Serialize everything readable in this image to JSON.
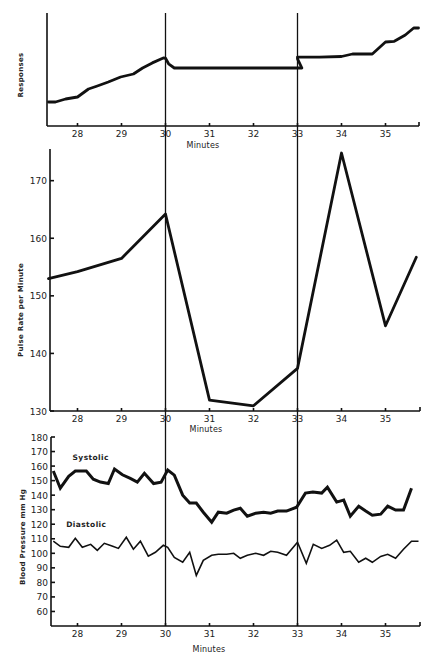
{
  "chart_data": [
    {
      "id": "responses",
      "type": "line",
      "title": "",
      "xlabel": "Minutes",
      "ylabel": "Responses",
      "xlim": [
        27.32,
        35.77
      ],
      "ylim": [
        0,
        100
      ],
      "y_units": "arbitrary (no numeric ticks shown)",
      "x_ticks": [
        28,
        29,
        30,
        31,
        32,
        33,
        34,
        35
      ],
      "x_tick_labels": [
        "28",
        "29",
        "30",
        "31",
        "32",
        "33",
        "34",
        "35"
      ],
      "y_ticks": [],
      "y_tick_labels": [],
      "markers_at_minutes": [
        30,
        33
      ],
      "grid": false,
      "series": [
        {
          "name": "Cumulative responses",
          "style": "thick",
          "x": [
            27.34,
            27.5,
            27.73,
            28.0,
            28.25,
            28.45,
            28.7,
            28.98,
            29.27,
            29.48,
            29.7,
            29.95,
            30.0,
            30.07,
            30.2,
            31.0,
            32.0,
            32.99,
            33.1,
            33.0,
            33.0,
            33.5,
            34.0,
            34.25,
            34.5,
            34.7,
            35.0,
            35.2,
            35.45,
            35.64,
            35.75
          ],
          "y": [
            21.2,
            21.2,
            23.9,
            25.7,
            32.7,
            35.4,
            38.9,
            43.4,
            46.0,
            51.3,
            55.8,
            60.2,
            60.0,
            55.0,
            51.3,
            51.3,
            51.3,
            51.3,
            51.3,
            59.5,
            61.0,
            61.0,
            61.5,
            63.7,
            63.7,
            63.7,
            74.3,
            75.0,
            80.5,
            86.7,
            86.7
          ]
        }
      ]
    },
    {
      "id": "pulse",
      "type": "line",
      "title": "",
      "xlabel": "Minutes",
      "ylabel": "Pulse Rate per Minute",
      "xlim": [
        27.32,
        35.77
      ],
      "ylim": [
        130,
        175.5
      ],
      "x_ticks": [
        28,
        29,
        30,
        31,
        32,
        33,
        34,
        35
      ],
      "x_tick_labels": [
        "28",
        "29",
        "30",
        "31",
        "32",
        "33",
        "34",
        "35"
      ],
      "y_ticks": [
        130,
        140,
        150,
        160,
        170
      ],
      "y_tick_labels": [
        "130",
        "140",
        "150",
        "160",
        "170"
      ],
      "markers_at_minutes": [
        30,
        33
      ],
      "grid": false,
      "series": [
        {
          "name": "Pulse rate",
          "style": "thick",
          "x": [
            27.34,
            28.0,
            29.0,
            30.0,
            31.0,
            32.0,
            33.0,
            34.0,
            35.0,
            35.7
          ],
          "y": [
            153.0,
            154.2,
            156.5,
            164.2,
            131.9,
            130.9,
            137.4,
            174.8,
            144.8,
            156.7
          ]
        }
      ]
    },
    {
      "id": "blood-pressure",
      "type": "line",
      "title": "",
      "xlabel": "Minutes",
      "ylabel": "Blood Pressure mm Hg",
      "xlim": [
        27.32,
        35.77
      ],
      "ylim": [
        50,
        180
      ],
      "x_ticks": [
        28,
        29,
        30,
        31,
        32,
        33,
        34,
        35
      ],
      "x_tick_labels": [
        "28",
        "29",
        "30",
        "31",
        "32",
        "33",
        "34",
        "35"
      ],
      "y_ticks": [
        60,
        70,
        80,
        90,
        100,
        110,
        120,
        130,
        140,
        150,
        160,
        170,
        180
      ],
      "y_tick_labels": [
        "60",
        "70",
        "80",
        "90",
        "100",
        "110",
        "120",
        "130",
        "140",
        "150",
        "160",
        "170",
        "180"
      ],
      "markers_at_minutes": [
        30,
        33
      ],
      "grid": false,
      "series": [
        {
          "name": "Systolic",
          "style": "thick",
          "x": [
            27.45,
            27.61,
            27.8,
            27.95,
            28.2,
            28.36,
            28.52,
            28.7,
            28.84,
            29.02,
            29.2,
            29.36,
            29.52,
            29.73,
            29.9,
            30.05,
            30.2,
            30.39,
            30.55,
            30.7,
            30.86,
            31.05,
            31.2,
            31.39,
            31.55,
            31.7,
            31.86,
            32.05,
            32.23,
            32.39,
            32.55,
            32.75,
            32.98,
            33.18,
            33.35,
            33.55,
            33.68,
            33.89,
            34.05,
            34.2,
            34.39,
            34.55,
            34.7,
            34.89,
            35.05,
            35.23,
            35.41,
            35.59
          ],
          "y": [
            156.6,
            144.8,
            153.0,
            156.6,
            156.6,
            151.0,
            149.0,
            148.0,
            158.0,
            154.0,
            151.5,
            149.0,
            155.0,
            148.0,
            149.0,
            157.2,
            153.8,
            140.0,
            134.5,
            134.5,
            128.3,
            121.4,
            128.3,
            127.6,
            129.7,
            131.0,
            125.5,
            127.6,
            128.3,
            127.6,
            129.0,
            129.0,
            131.7,
            141.4,
            142.1,
            141.4,
            145.5,
            135.2,
            136.6,
            125.5,
            132.4,
            129.0,
            126.2,
            126.9,
            132.4,
            129.7,
            129.7,
            144.8
          ]
        },
        {
          "name": "Diastolic",
          "style": "thin",
          "x": [
            27.45,
            27.61,
            27.8,
            27.95,
            28.11,
            28.3,
            28.45,
            28.61,
            28.8,
            28.93,
            29.11,
            29.27,
            29.43,
            29.61,
            29.77,
            29.95,
            30.05,
            30.2,
            30.39,
            30.55,
            30.7,
            30.86,
            31.05,
            31.2,
            31.39,
            31.55,
            31.7,
            31.86,
            32.05,
            32.23,
            32.39,
            32.55,
            32.75,
            33.0,
            33.2,
            33.36,
            33.55,
            33.73,
            33.89,
            34.05,
            34.2,
            34.39,
            34.55,
            34.7,
            34.89,
            35.05,
            35.23,
            35.41,
            35.59,
            35.75
          ],
          "y": [
            108.3,
            104.8,
            104.1,
            110.3,
            104.1,
            106.2,
            102.1,
            106.9,
            104.8,
            103.4,
            111.0,
            102.8,
            108.3,
            98.0,
            100.7,
            105.5,
            104.1,
            97.2,
            93.8,
            100.7,
            84.8,
            95.2,
            98.6,
            99.3,
            99.3,
            100.0,
            96.6,
            98.6,
            100.0,
            98.6,
            101.4,
            100.7,
            98.6,
            107.6,
            93.1,
            106.2,
            103.4,
            105.5,
            109.0,
            100.7,
            101.4,
            93.8,
            96.6,
            93.8,
            97.9,
            99.3,
            96.6,
            102.8,
            108.3,
            108.3
          ]
        }
      ],
      "annotations": [
        {
          "text": "Systolic",
          "x": 28.3,
          "y": 164
        },
        {
          "text": "Diastolic",
          "x": 28.2,
          "y": 118
        }
      ]
    }
  ]
}
